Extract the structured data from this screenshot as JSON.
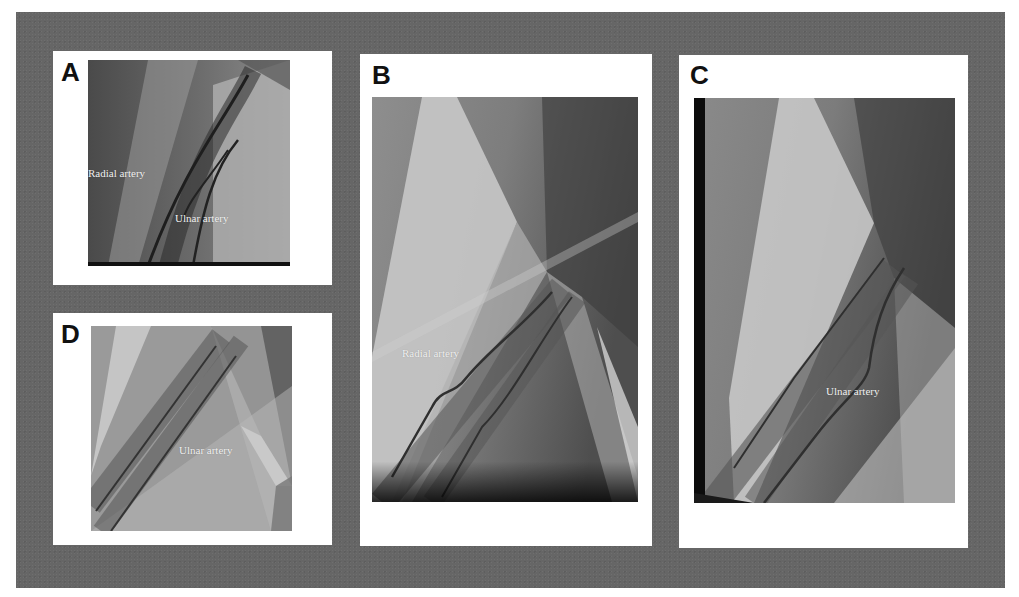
{
  "figure": {
    "panels": [
      {
        "id": "A",
        "label": "A",
        "annotations": [
          "Radial artery",
          "Ulnar artery"
        ]
      },
      {
        "id": "B",
        "label": "B",
        "annotations": [
          "Radial artery"
        ]
      },
      {
        "id": "C",
        "label": "C",
        "annotations": [
          "Ulnar artery"
        ]
      },
      {
        "id": "D",
        "label": "D",
        "annotations": [
          "Ulnar artery"
        ]
      }
    ]
  },
  "colors": {
    "frame_gray": "#666666",
    "panel_white": "#ffffff",
    "label_text": "#111111",
    "annotation_text": "#f2f2f2"
  }
}
